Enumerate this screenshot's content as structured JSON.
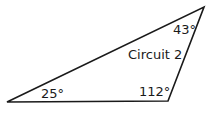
{
  "diagram": {
    "title": "Circuit 2",
    "shape": "triangle",
    "stroke_color": "#1a1a1a",
    "vertices": [
      {
        "name": "bottom-left",
        "x": 7,
        "y": 102,
        "angle_label": "25°"
      },
      {
        "name": "bottom-right",
        "x": 168,
        "y": 101,
        "angle_label": "112°"
      },
      {
        "name": "top-right",
        "x": 204,
        "y": 7,
        "angle_label": "43°"
      }
    ]
  }
}
